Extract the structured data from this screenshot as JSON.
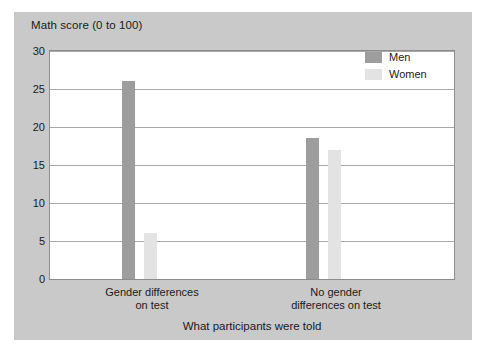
{
  "chart_data": {
    "type": "bar",
    "title": "Math score (0 to 100)",
    "xlabel": "What participants were told",
    "ylabel": "Math score (0 to 100)",
    "categories": [
      "Gender differences on test",
      "No gender differences on test"
    ],
    "category_lines": [
      [
        "Gender differences",
        "on test"
      ],
      [
        "No gender",
        "differences on test"
      ]
    ],
    "series": [
      {
        "name": "Men",
        "color": "#9d9d9d",
        "values": [
          26,
          18.5
        ]
      },
      {
        "name": "Women",
        "color": "#e3e3e3",
        "values": [
          6,
          17
        ]
      }
    ],
    "ylim": [
      0,
      30
    ],
    "ytick_step": 5,
    "yticks": [
      30,
      25,
      20,
      15,
      10,
      5,
      0
    ],
    "ytick_labels": [
      "30",
      "25",
      "20",
      "15",
      "10",
      "5",
      "0"
    ],
    "grid": true,
    "legend_position": "top-right",
    "panel_color": "#c9c9c9",
    "plot_background": "#ffffff"
  },
  "legend": {
    "items": [
      {
        "label": "Men"
      },
      {
        "label": "Women"
      }
    ]
  }
}
